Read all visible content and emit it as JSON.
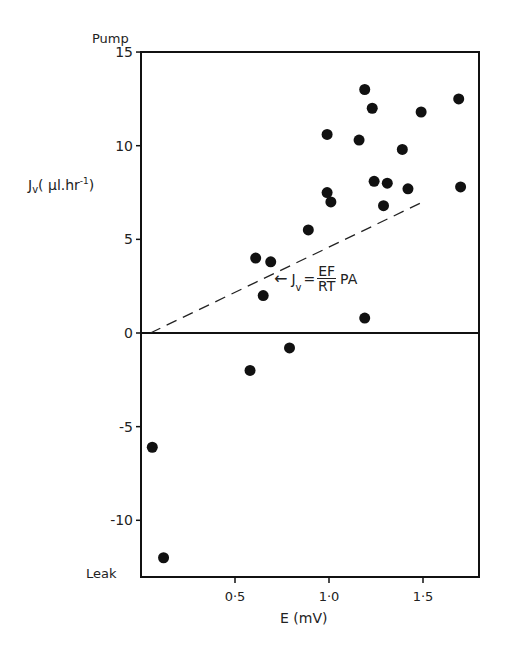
{
  "chart_data": {
    "type": "scatter",
    "title": "",
    "xlabel": "E (mV)",
    "ylabel": "Jv (µl.hr⁻¹)",
    "y_top_label": "Pump",
    "y_bottom_label": "Leak",
    "xlim": [
      0,
      1.8
    ],
    "ylim": [
      -12.9,
      15
    ],
    "x_ticks": [
      0.5,
      1.0,
      1.5
    ],
    "x_tick_labels": [
      "0·5",
      "1·0",
      "1·5"
    ],
    "y_ticks": [
      15,
      10,
      5,
      0,
      -5,
      -10
    ],
    "y_tick_labels": [
      "15",
      "10",
      "5",
      "0",
      "-5",
      "-10"
    ],
    "grid": false,
    "points": [
      {
        "x": 0.06,
        "y": -6.1
      },
      {
        "x": 0.12,
        "y": -12.0
      },
      {
        "x": 0.58,
        "y": -2.0
      },
      {
        "x": 0.61,
        "y": 4.0
      },
      {
        "x": 0.65,
        "y": 2.0
      },
      {
        "x": 0.69,
        "y": 3.8
      },
      {
        "x": 0.79,
        "y": -0.8
      },
      {
        "x": 0.89,
        "y": 5.5
      },
      {
        "x": 0.99,
        "y": 10.6
      },
      {
        "x": 0.99,
        "y": 7.5
      },
      {
        "x": 1.01,
        "y": 7.0
      },
      {
        "x": 1.16,
        "y": 10.3
      },
      {
        "x": 1.19,
        "y": 13.0
      },
      {
        "x": 1.19,
        "y": 0.8
      },
      {
        "x": 1.23,
        "y": 12.0
      },
      {
        "x": 1.24,
        "y": 8.1
      },
      {
        "x": 1.29,
        "y": 6.8
      },
      {
        "x": 1.31,
        "y": 8.0
      },
      {
        "x": 1.39,
        "y": 9.8
      },
      {
        "x": 1.42,
        "y": 7.7
      },
      {
        "x": 1.49,
        "y": 11.8
      },
      {
        "x": 1.69,
        "y": 12.5
      },
      {
        "x": 1.7,
        "y": 7.8
      }
    ],
    "reference_line": {
      "style": "dashed",
      "from": {
        "x": 0.05,
        "y": 0
      },
      "to": {
        "x": 1.5,
        "y": 7.0
      },
      "annotation": "Jv = EF/RT PA"
    }
  },
  "annotation": {
    "lhs": "J",
    "sub": "v",
    "eq": "=",
    "num": "EF",
    "den": "RT",
    "rhs": "PA",
    "arrow": "←"
  }
}
